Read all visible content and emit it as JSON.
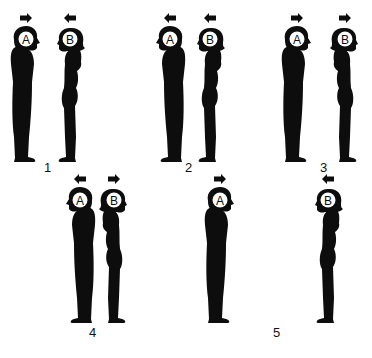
{
  "colors": {
    "figure": "#0d0d0d",
    "background": "#ffffff",
    "head_letter_bg": "#ffffff"
  },
  "panels": [
    {
      "label": "1",
      "figures": [
        {
          "letter": "A",
          "sex": "male",
          "faces": "right",
          "arrow": "right",
          "x": 26,
          "y": 12,
          "scale": 1.0
        },
        {
          "letter": "B",
          "sex": "female",
          "faces": "left",
          "arrow": "left",
          "x": 70,
          "y": 12,
          "scale": 1.0
        }
      ],
      "label_pos": {
        "x": 44,
        "y": 160
      }
    },
    {
      "label": "2",
      "figures": [
        {
          "letter": "A",
          "sex": "male",
          "faces": "left",
          "arrow": "left",
          "x": 170,
          "y": 12,
          "scale": 1.0
        },
        {
          "letter": "B",
          "sex": "female",
          "faces": "left",
          "arrow": "left",
          "x": 210,
          "y": 12,
          "scale": 1.0
        }
      ],
      "label_pos": {
        "x": 185,
        "y": 160
      }
    },
    {
      "label": "3",
      "figures": [
        {
          "letter": "A",
          "sex": "male",
          "faces": "right",
          "arrow": "right",
          "x": 297,
          "y": 12,
          "scale": 1.0
        },
        {
          "letter": "B",
          "sex": "female",
          "faces": "right",
          "arrow": "right",
          "x": 345,
          "y": 12,
          "scale": 1.0
        }
      ],
      "label_pos": {
        "x": 320,
        "y": 160
      }
    },
    {
      "label": "4",
      "figures": [
        {
          "letter": "A",
          "sex": "male",
          "faces": "left",
          "arrow": "left",
          "x": 80,
          "y": 173,
          "scale": 1.0
        },
        {
          "letter": "B",
          "sex": "female",
          "faces": "right",
          "arrow": "right",
          "x": 114,
          "y": 173,
          "scale": 1.0
        }
      ],
      "label_pos": {
        "x": 89,
        "y": 325
      }
    },
    {
      "label": "5",
      "figures": [
        {
          "letter": "A",
          "sex": "male",
          "faces": "right",
          "arrow": "right",
          "x": 220,
          "y": 173,
          "scale": 1.0
        },
        {
          "letter": "B",
          "sex": "female",
          "faces": "left",
          "arrow": "left",
          "x": 328,
          "y": 173,
          "scale": 1.0
        }
      ],
      "label_pos": {
        "x": 273,
        "y": 325
      }
    }
  ]
}
